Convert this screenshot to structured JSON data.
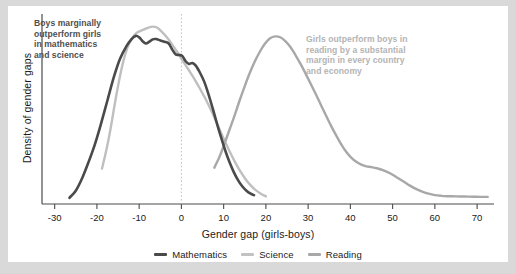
{
  "chart_data": {
    "type": "line",
    "title": "",
    "subtitle": "",
    "xlabel": "Gender gap (girls-boys)",
    "ylabel": "Density of gender gaps",
    "xlim": [
      -33,
      74
    ],
    "ylim": [
      0,
      1.06
    ],
    "xticks": [
      -30,
      -20,
      -10,
      0,
      10,
      20,
      30,
      40,
      50,
      60,
      70
    ],
    "xtick_labels": [
      "-30",
      "-20",
      "-10",
      "0",
      "10",
      "20",
      "30",
      "40",
      "50",
      "60",
      "70"
    ],
    "yticks": [],
    "ytick_labels": [],
    "grid": false,
    "reference_line": {
      "x": 0,
      "style": "dotted",
      "color": "#bdbdbd"
    },
    "legend_position": "bottom-center",
    "series": [
      {
        "name": "Mathematics",
        "color": "#4a4a4a",
        "points": [
          [
            -26.5,
            0.035
          ],
          [
            -25.0,
            0.075
          ],
          [
            -23.5,
            0.145
          ],
          [
            -22.0,
            0.235
          ],
          [
            -20.5,
            0.335
          ],
          [
            -19.0,
            0.455
          ],
          [
            -17.5,
            0.585
          ],
          [
            -16.0,
            0.715
          ],
          [
            -14.5,
            0.82
          ],
          [
            -13.0,
            0.89
          ],
          [
            -11.8,
            0.93
          ],
          [
            -10.8,
            0.948
          ],
          [
            -10.0,
            0.94
          ],
          [
            -9.2,
            0.918
          ],
          [
            -8.4,
            0.905
          ],
          [
            -7.6,
            0.915
          ],
          [
            -6.8,
            0.928
          ],
          [
            -6.0,
            0.93
          ],
          [
            -5.0,
            0.922
          ],
          [
            -4.0,
            0.915
          ],
          [
            -3.0,
            0.905
          ],
          [
            -2.2,
            0.872
          ],
          [
            -1.4,
            0.845
          ],
          [
            -0.6,
            0.84
          ],
          [
            0.2,
            0.835
          ],
          [
            1.0,
            0.805
          ],
          [
            1.8,
            0.79
          ],
          [
            2.6,
            0.795
          ],
          [
            3.4,
            0.78
          ],
          [
            4.4,
            0.74
          ],
          [
            5.4,
            0.69
          ],
          [
            6.4,
            0.62
          ],
          [
            7.4,
            0.54
          ],
          [
            8.4,
            0.455
          ],
          [
            9.4,
            0.375
          ],
          [
            10.4,
            0.3
          ],
          [
            11.4,
            0.235
          ],
          [
            12.4,
            0.18
          ],
          [
            13.4,
            0.135
          ],
          [
            14.4,
            0.1
          ],
          [
            15.4,
            0.075
          ],
          [
            16.4,
            0.058
          ],
          [
            17.2,
            0.05
          ]
        ]
      },
      {
        "name": "Science",
        "color": "#bfbfbf",
        "points": [
          [
            -18.8,
            0.2
          ],
          [
            -17.8,
            0.3
          ],
          [
            -16.8,
            0.42
          ],
          [
            -15.8,
            0.56
          ],
          [
            -14.8,
            0.69
          ],
          [
            -13.8,
            0.8
          ],
          [
            -12.8,
            0.88
          ],
          [
            -11.8,
            0.93
          ],
          [
            -10.8,
            0.96
          ],
          [
            -9.8,
            0.975
          ],
          [
            -8.8,
            0.985
          ],
          [
            -7.8,
            0.995
          ],
          [
            -6.8,
            1.0
          ],
          [
            -5.8,
            0.995
          ],
          [
            -4.8,
            0.975
          ],
          [
            -3.8,
            0.95
          ],
          [
            -2.8,
            0.92
          ],
          [
            -1.8,
            0.885
          ],
          [
            -0.8,
            0.85
          ],
          [
            0.2,
            0.812
          ],
          [
            1.2,
            0.775
          ],
          [
            2.2,
            0.738
          ],
          [
            3.2,
            0.7
          ],
          [
            4.4,
            0.65
          ],
          [
            5.6,
            0.598
          ],
          [
            6.8,
            0.54
          ],
          [
            8.0,
            0.478
          ],
          [
            9.2,
            0.412
          ],
          [
            10.4,
            0.348
          ],
          [
            11.6,
            0.288
          ],
          [
            12.8,
            0.232
          ],
          [
            14.0,
            0.182
          ],
          [
            15.2,
            0.14
          ],
          [
            16.4,
            0.105
          ],
          [
            17.6,
            0.078
          ],
          [
            18.8,
            0.058
          ],
          [
            20.0,
            0.043
          ]
        ]
      },
      {
        "name": "Reading",
        "color": "#a8a8a8",
        "points": [
          [
            7.8,
            0.205
          ],
          [
            9.0,
            0.265
          ],
          [
            10.2,
            0.34
          ],
          [
            11.4,
            0.42
          ],
          [
            12.6,
            0.5
          ],
          [
            13.8,
            0.585
          ],
          [
            15.0,
            0.665
          ],
          [
            16.2,
            0.74
          ],
          [
            17.4,
            0.805
          ],
          [
            18.6,
            0.86
          ],
          [
            19.8,
            0.905
          ],
          [
            21.0,
            0.935
          ],
          [
            22.2,
            0.945
          ],
          [
            23.4,
            0.94
          ],
          [
            24.6,
            0.918
          ],
          [
            25.8,
            0.885
          ],
          [
            27.0,
            0.84
          ],
          [
            28.2,
            0.79
          ],
          [
            29.4,
            0.735
          ],
          [
            30.6,
            0.678
          ],
          [
            31.8,
            0.62
          ],
          [
            33.0,
            0.56
          ],
          [
            34.2,
            0.5
          ],
          [
            35.4,
            0.442
          ],
          [
            36.6,
            0.388
          ],
          [
            37.8,
            0.338
          ],
          [
            39.0,
            0.295
          ],
          [
            40.2,
            0.262
          ],
          [
            41.4,
            0.238
          ],
          [
            42.6,
            0.222
          ],
          [
            43.8,
            0.212
          ],
          [
            45.0,
            0.208
          ],
          [
            46.5,
            0.2
          ],
          [
            48.0,
            0.188
          ],
          [
            49.5,
            0.172
          ],
          [
            51.0,
            0.15
          ],
          [
            52.5,
            0.128
          ],
          [
            54.0,
            0.105
          ],
          [
            55.5,
            0.085
          ],
          [
            57.0,
            0.07
          ],
          [
            58.5,
            0.058
          ],
          [
            60.0,
            0.05
          ],
          [
            61.5,
            0.046
          ],
          [
            63.0,
            0.044
          ],
          [
            65.0,
            0.043
          ],
          [
            67.0,
            0.042
          ],
          [
            69.0,
            0.041
          ],
          [
            71.0,
            0.04
          ],
          [
            72.5,
            0.04
          ]
        ]
      }
    ],
    "annotations": [
      {
        "id": "left",
        "text": "Boys marginally\noutperform girls\nin mathematics\nand science",
        "color": "#4f4f4f"
      },
      {
        "id": "right",
        "text": "Girls outperform boys in\nreading by a substantial\nmargin in every country\nand economy",
        "color": "#b4b4b4"
      }
    ]
  },
  "legend": {
    "items": [
      {
        "label": "Mathematics",
        "color": "#4a4a4a"
      },
      {
        "label": "Science",
        "color": "#c2c2c2"
      },
      {
        "label": "Reading",
        "color": "#a8a8a8"
      }
    ]
  },
  "colors": {
    "page_background": "#d9d9d9",
    "card_background": "#ffffff",
    "axis": "#4a4a4a",
    "text": "#1a1a1a"
  }
}
